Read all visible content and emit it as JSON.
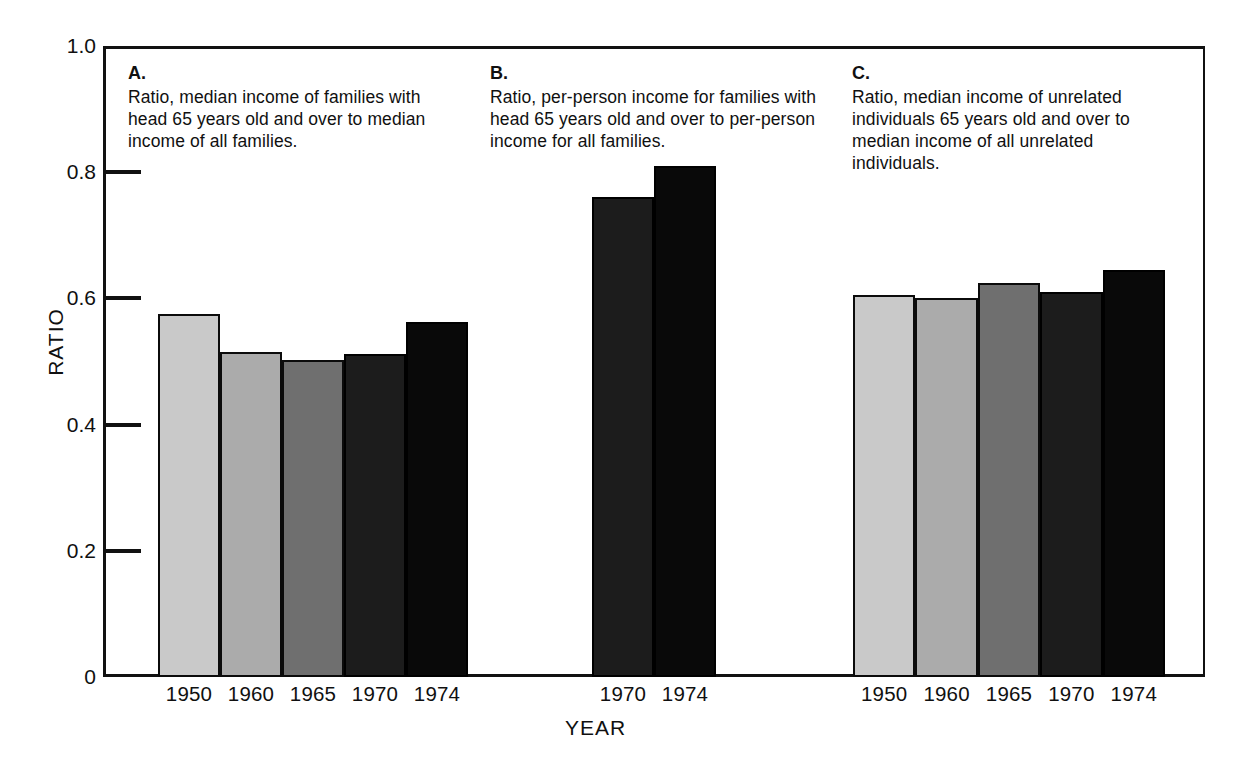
{
  "axes": {
    "ylabel": "RATIO",
    "xlabel": "YEAR",
    "yticks": [
      "1.0",
      "0.8",
      "0.6",
      "0.4",
      "0.2",
      "0"
    ],
    "ylim": [
      0,
      1.0
    ]
  },
  "panels": [
    {
      "letter": "A.",
      "caption": "Ratio, median income of families with head 65 years old and over to median income of all families.",
      "categories": [
        "1950",
        "1960",
        "1965",
        "1970",
        "1974"
      ],
      "values": [
        0.575,
        0.515,
        0.503,
        0.512,
        0.562
      ]
    },
    {
      "letter": "B.",
      "caption": "Ratio, per-person income for families with head 65 years old and over to per-person income for all families.",
      "categories": [
        "1970",
        "1974"
      ],
      "values": [
        0.76,
        0.81
      ]
    },
    {
      "letter": "C.",
      "caption": "Ratio, median income of unrelated individuals 65 years old and over to median income of all unrelated individuals.",
      "categories": [
        "1950",
        "1960",
        "1965",
        "1970",
        "1974"
      ],
      "values": [
        0.605,
        0.6,
        0.625,
        0.61,
        0.645
      ]
    }
  ],
  "colors": {
    "shade_1": "#c9c9c9",
    "shade_2": "#ababab",
    "shade_3": "#6f6f6f",
    "shade_4": "#1c1c1c",
    "shade_5": "#090909",
    "axis": "#111111",
    "background": "#ffffff"
  },
  "chart_data": {
    "type": "bar",
    "title": "",
    "xlabel": "YEAR",
    "ylabel": "RATIO",
    "ylim": [
      0,
      1.0
    ],
    "yticks": [
      0,
      0.2,
      0.4,
      0.6,
      0.8,
      1.0
    ],
    "grid": false,
    "legend": "none",
    "panels": [
      {
        "id": "A",
        "label": "A.",
        "description": "Ratio, median income of families with head 65 years old and over to median income of all families.",
        "categories": [
          "1950",
          "1960",
          "1965",
          "1970",
          "1974"
        ],
        "values": [
          0.575,
          0.515,
          0.503,
          0.512,
          0.562
        ]
      },
      {
        "id": "B",
        "label": "B.",
        "description": "Ratio, per-person income for families with head 65 years old and over to per-person income for all families.",
        "categories": [
          "1970",
          "1974"
        ],
        "values": [
          0.76,
          0.81
        ]
      },
      {
        "id": "C",
        "label": "C.",
        "description": "Ratio, median income of unrelated individuals 65 years old and over to median income of all unrelated individuals.",
        "categories": [
          "1950",
          "1960",
          "1965",
          "1970",
          "1974"
        ],
        "values": [
          0.605,
          0.6,
          0.625,
          0.61,
          0.645
        ]
      }
    ]
  }
}
